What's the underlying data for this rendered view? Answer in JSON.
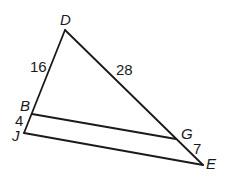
{
  "figure": {
    "type": "triangle-with-parallel-segment",
    "stroke_color": "#1a1a1a",
    "vertices": {
      "D": {
        "label": "D",
        "x": 65,
        "y": 30
      },
      "B": {
        "label": "B",
        "x": 32,
        "y": 114
      },
      "J": {
        "label": "J",
        "x": 24,
        "y": 133
      },
      "G": {
        "label": "G",
        "x": 176,
        "y": 139
      },
      "E": {
        "label": "E",
        "x": 203,
        "y": 165
      }
    },
    "segments": [
      {
        "from": "D",
        "to": "J"
      },
      {
        "from": "D",
        "to": "E"
      },
      {
        "from": "J",
        "to": "E"
      },
      {
        "from": "B",
        "to": "G"
      }
    ],
    "measures": {
      "DB": "16",
      "DG": "28",
      "BJ": "4",
      "GE": "7"
    }
  }
}
